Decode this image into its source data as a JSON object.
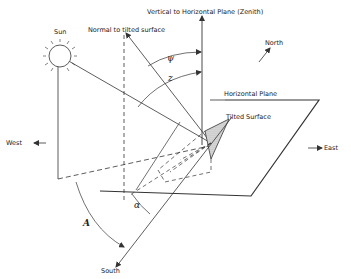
{
  "diagram": {
    "labels": {
      "zenith": "Vertical to Horizontal Plane (Zenith)",
      "sun": "Sun",
      "normal": "Normal to tilted surface",
      "north": "North",
      "horizontal_plane": "Horizontal Plane",
      "tilted_surface": "Tilted Surface",
      "west": "West",
      "east": "East",
      "south": "South"
    },
    "angles": {
      "psi": "ψ",
      "z": "z",
      "alpha": "α",
      "azimuth": "A"
    },
    "colors": {
      "line": "#333333",
      "hatch": "#bdbdbd",
      "background": "#ffffff"
    }
  }
}
